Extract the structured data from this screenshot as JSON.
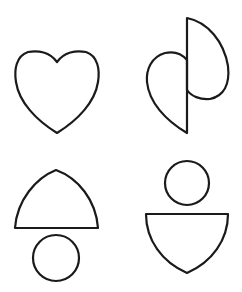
{
  "figure": {
    "background": "#ffffff",
    "stroke_color": "#1a1a1a",
    "panels": [
      {
        "id": "heart",
        "description": "whole heart shape"
      },
      {
        "id": "split-heart",
        "description": "heart split vertically with the right half shifted upward"
      },
      {
        "id": "dome-over-circle",
        "description": "rounded dome with flat base above a circle"
      },
      {
        "id": "circle-over-shield",
        "description": "circle above an inverted shield / bowl shape"
      }
    ]
  }
}
